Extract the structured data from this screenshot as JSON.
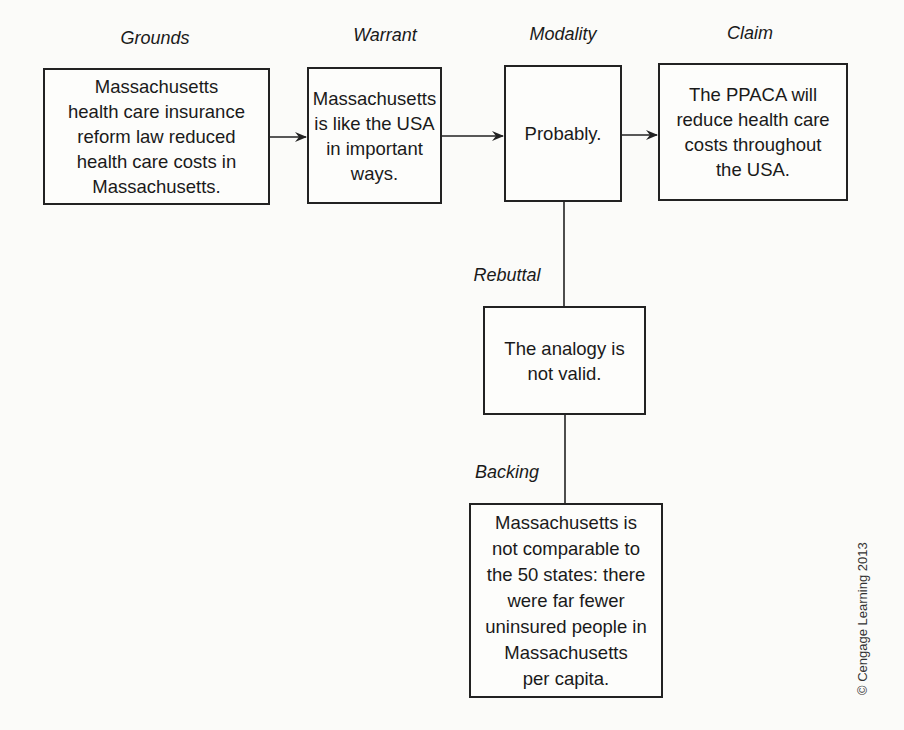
{
  "diagram": {
    "type": "Toulmin argument model",
    "labels": {
      "grounds": "Grounds",
      "warrant": "Warrant",
      "modality": "Modality",
      "claim": "Claim",
      "rebuttal": "Rebuttal",
      "backing": "Backing"
    },
    "boxes": {
      "grounds": "Massachusetts\nhealth care insurance\nreform law reduced\nhealth care costs in\nMassachusetts.",
      "warrant": "Massachusetts\nis like the USA\nin important\nways.",
      "modality": "Probably.",
      "claim": "The PPACA will\nreduce health care\ncosts throughout\nthe USA.",
      "rebuttal": "The analogy is\nnot valid.",
      "backing": "Massachusetts is\nnot comparable to\nthe 50 states: there\nwere far fewer\nuninsured people in\nMassachusetts\nper capita."
    },
    "copyright": "© Cengage Learning 2013"
  }
}
